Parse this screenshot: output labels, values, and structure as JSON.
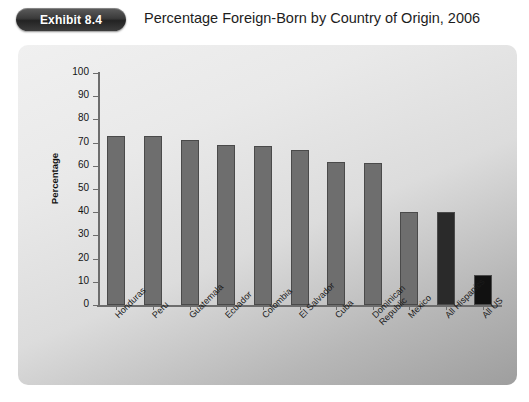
{
  "header": {
    "badge_label": "Exhibit 8.4",
    "title": "Percentage Foreign-Born by Country of Origin, 2006"
  },
  "chart_data": {
    "type": "bar",
    "title": "Percentage Foreign-Born by Country of Origin, 2006",
    "xlabel": "",
    "ylabel": "Percentage",
    "ylim": [
      0,
      100
    ],
    "yticks": [
      0,
      10,
      20,
      30,
      40,
      50,
      60,
      70,
      80,
      90,
      100
    ],
    "ytick_labels": [
      "0",
      "10",
      "20",
      "30",
      "40",
      "50",
      "60",
      "70",
      "80",
      "90",
      "100"
    ],
    "grid": false,
    "legend": null,
    "categories": [
      "Honduras",
      "Peru",
      "Guatemala",
      "Ecuador",
      "Colombia",
      "El Salvador",
      "Cuba",
      "Dominican\nRepublic",
      "Mexico",
      "All Hispanics",
      "All US"
    ],
    "values": [
      73,
      73,
      71,
      69,
      68.5,
      67,
      61.5,
      61,
      40,
      40,
      13
    ],
    "bar_colors": [
      "#6e6e6e",
      "#6e6e6e",
      "#6e6e6e",
      "#6e6e6e",
      "#6e6e6e",
      "#6e6e6e",
      "#6e6e6e",
      "#6e6e6e",
      "#6e6e6e",
      "#2a2a2a",
      "#111111"
    ]
  },
  "colors": {
    "badge_background": "#333333",
    "badge_text": "#ffffff",
    "title_text": "#1d1d1d",
    "panel_light": "#f0f0f0",
    "panel_dark": "#9e9e9e",
    "axis": "#6d6d6d",
    "bar_default": "#6e6e6e",
    "bar_highlight": "#2a2a2a",
    "bar_us": "#111111"
  }
}
